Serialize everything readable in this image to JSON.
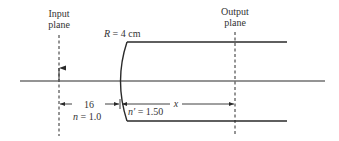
{
  "diagram": {
    "input_plane": {
      "line1": "Input",
      "line2": "plane"
    },
    "output_plane": {
      "line1": "Output",
      "line2": "plane"
    },
    "radius_label": {
      "symbol": "R",
      "text": " = 4 cm"
    },
    "distance_left": "16",
    "distance_right": "x",
    "index_left": {
      "symbol": "n",
      "text": " = 1.0"
    },
    "index_right": {
      "symbol": "n′",
      "text": " = 1.50"
    },
    "colors": {
      "line": "#2a2a2a",
      "text": "#333333",
      "background": "#ffffff"
    }
  }
}
